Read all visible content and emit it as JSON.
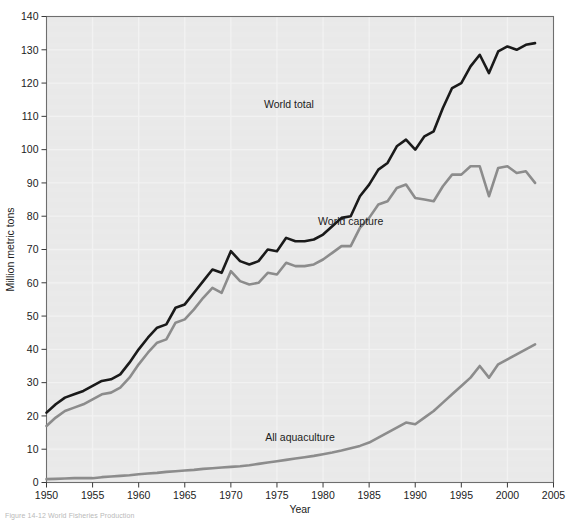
{
  "figure": {
    "caption": "Figure 14-12 World Fisheries Production",
    "background": "#ffffff",
    "plot_background": "#e9e9e9"
  },
  "chart_data": {
    "type": "line",
    "title": "",
    "xlabel": "Year",
    "ylabel": "Million metric tons",
    "xlim": [
      1950,
      2005
    ],
    "ylim": [
      0,
      140
    ],
    "xticks": [
      1950,
      1955,
      1960,
      1965,
      1970,
      1975,
      1980,
      1985,
      1990,
      1995,
      2000,
      2005
    ],
    "yticks": [
      0,
      10,
      20,
      30,
      40,
      50,
      60,
      70,
      80,
      90,
      100,
      110,
      120,
      130,
      140
    ],
    "grid": true,
    "legend_position": "inline-annotations",
    "x": [
      1950,
      1951,
      1952,
      1953,
      1954,
      1955,
      1956,
      1957,
      1958,
      1959,
      1960,
      1961,
      1962,
      1963,
      1964,
      1965,
      1966,
      1967,
      1968,
      1969,
      1970,
      1971,
      1972,
      1973,
      1974,
      1975,
      1976,
      1977,
      1978,
      1979,
      1980,
      1981,
      1982,
      1983,
      1984,
      1985,
      1986,
      1987,
      1988,
      1989,
      1990,
      1991,
      1992,
      1993,
      1994,
      1995,
      1996,
      1997,
      1998,
      1999,
      2000,
      2001,
      2002,
      2003
    ],
    "series": [
      {
        "name": "World total",
        "color": "#1a1a1a",
        "width": 2.6,
        "label_x": 1976.3,
        "label_y": 112.5,
        "values": [
          21.0,
          23.5,
          25.5,
          26.5,
          27.5,
          29.0,
          30.5,
          31.0,
          32.5,
          36.0,
          40.0,
          43.5,
          46.5,
          47.5,
          52.5,
          53.5,
          57.0,
          60.5,
          64.0,
          63.0,
          69.5,
          66.5,
          65.5,
          66.5,
          70.0,
          69.5,
          73.5,
          72.5,
          72.5,
          73.0,
          74.5,
          77.0,
          79.5,
          80.0,
          86.0,
          89.5,
          94.0,
          96.0,
          101.0,
          103.0,
          100.0,
          104.0,
          105.5,
          112.5,
          118.5,
          120.0,
          125.0,
          128.5,
          123.0,
          129.5,
          131.0,
          130.0,
          131.5,
          132.0
        ]
      },
      {
        "name": "World capture",
        "color": "#8c8c8c",
        "width": 2.6,
        "label_x": 1983.0,
        "label_y": 77.5,
        "values": [
          17.0,
          19.5,
          21.5,
          22.5,
          23.5,
          25.0,
          26.5,
          27.0,
          28.5,
          31.5,
          35.5,
          39.0,
          42.0,
          43.0,
          48.0,
          49.0,
          52.0,
          55.5,
          58.5,
          57.0,
          63.5,
          60.5,
          59.5,
          60.0,
          63.0,
          62.5,
          66.0,
          65.0,
          65.0,
          65.5,
          67.0,
          69.0,
          71.0,
          71.0,
          76.5,
          79.5,
          83.5,
          84.5,
          88.5,
          89.5,
          85.5,
          85.0,
          84.5,
          89.0,
          92.5,
          92.5,
          95.0,
          95.0,
          86.0,
          94.5,
          95.0,
          93.0,
          93.5,
          90.0
        ]
      },
      {
        "name": "All aquaculture",
        "color": "#8c8c8c",
        "width": 2.6,
        "label_x": 1977.5,
        "label_y": 12.5,
        "values": [
          1.0,
          1.1,
          1.2,
          1.3,
          1.3,
          1.3,
          1.6,
          1.8,
          2.0,
          2.2,
          2.5,
          2.7,
          2.9,
          3.2,
          3.4,
          3.6,
          3.8,
          4.1,
          4.3,
          4.5,
          4.7,
          4.9,
          5.2,
          5.6,
          6.0,
          6.4,
          6.8,
          7.2,
          7.6,
          8.0,
          8.5,
          9.0,
          9.6,
          10.3,
          11.0,
          12.0,
          13.5,
          15.0,
          16.5,
          18.0,
          17.5,
          19.5,
          21.5,
          24.0,
          26.5,
          29.0,
          31.5,
          35.0,
          31.5,
          35.5,
          37.0,
          38.5,
          40.0,
          41.5
        ]
      }
    ]
  }
}
